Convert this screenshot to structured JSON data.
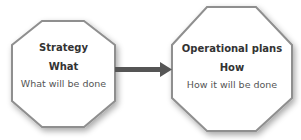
{
  "diagram": {
    "nodes": [
      {
        "id": "strategy",
        "title": "Strategy",
        "question": "What",
        "description": "What will be done"
      },
      {
        "id": "operational",
        "title": "Operational plans",
        "question": "How",
        "description": "How it will be done"
      }
    ],
    "edges": [
      {
        "from": "strategy",
        "to": "operational",
        "style": "arrow"
      }
    ],
    "colors": {
      "node_fill": "#ffffff",
      "node_border": "#8a8a8a",
      "arrow": "#555555",
      "shadow": "#cccccc"
    }
  }
}
